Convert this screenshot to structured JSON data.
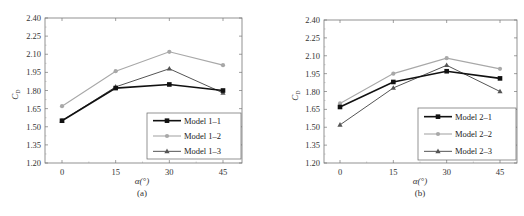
{
  "chart_data": [
    {
      "type": "line",
      "panel": "(a)",
      "title": "",
      "xlabel": "α(°)",
      "ylabel": "C_D",
      "x": [
        0,
        15,
        30,
        45
      ],
      "xticks": [
        "0",
        "15",
        "30",
        "45"
      ],
      "yticks": [
        "1.20",
        "1.35",
        "1.50",
        "1.65",
        "1.80",
        "1.95",
        "2.10",
        "2.25",
        "2.40"
      ],
      "ylim": [
        1.2,
        2.4
      ],
      "grid": false,
      "legend_position": "lower right",
      "series": [
        {
          "name": "Model 1–1",
          "values": [
            1.55,
            1.82,
            1.85,
            1.8
          ],
          "color": "#111111",
          "marker": "square",
          "width": 1.6
        },
        {
          "name": "Model 1–2",
          "values": [
            1.67,
            1.96,
            2.12,
            2.01
          ],
          "color": "#a8a8a8",
          "marker": "circle",
          "width": 1.1
        },
        {
          "name": "Model 1–3",
          "values": [
            1.55,
            1.83,
            1.98,
            1.78
          ],
          "color": "#555555",
          "marker": "triangle",
          "width": 1.0
        }
      ]
    },
    {
      "type": "line",
      "panel": "(b)",
      "title": "",
      "xlabel": "α(°)",
      "ylabel": "C_D",
      "x": [
        0,
        15,
        30,
        45
      ],
      "xticks": [
        "0",
        "15",
        "30",
        "45"
      ],
      "yticks": [
        "1.20",
        "1.35",
        "1.50",
        "1.65",
        "1.80",
        "1.95",
        "2.10",
        "2.25",
        "2.40"
      ],
      "ylim": [
        1.2,
        2.4
      ],
      "grid": false,
      "legend_position": "lower right",
      "series": [
        {
          "name": "Model 2–1",
          "values": [
            1.67,
            1.88,
            1.97,
            1.91
          ],
          "color": "#111111",
          "marker": "square",
          "width": 1.6
        },
        {
          "name": "Model 2–2",
          "values": [
            1.7,
            1.95,
            2.08,
            1.99
          ],
          "color": "#a8a8a8",
          "marker": "circle",
          "width": 1.1
        },
        {
          "name": "Model 2–3",
          "values": [
            1.52,
            1.83,
            2.02,
            1.8
          ],
          "color": "#555555",
          "marker": "triangle",
          "width": 1.0
        }
      ]
    }
  ],
  "panels": {
    "a": {
      "caption": "(a)",
      "xlabel": "α(°)",
      "ylabel_main": "C",
      "ylabel_sub": "D"
    },
    "b": {
      "caption": "(b)",
      "xlabel": "α(°)",
      "ylabel_main": "C",
      "ylabel_sub": "D"
    }
  }
}
